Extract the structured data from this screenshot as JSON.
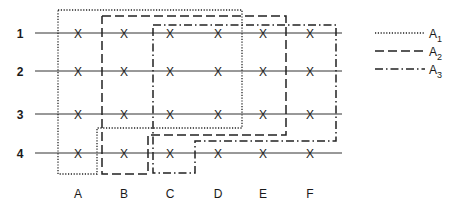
{
  "diagram": {
    "rows": [
      {
        "label": "1",
        "y": 33
      },
      {
        "label": "2",
        "y": 71
      },
      {
        "label": "3",
        "y": 114
      },
      {
        "label": "4",
        "y": 153
      }
    ],
    "columns": [
      {
        "label": "A",
        "x": 78
      },
      {
        "label": "B",
        "x": 124
      },
      {
        "label": "C",
        "x": 170
      },
      {
        "label": "D",
        "x": 218
      },
      {
        "label": "E",
        "x": 263
      },
      {
        "label": "F",
        "x": 310
      }
    ],
    "marker": "X",
    "line_x_start": 35,
    "line_x_end": 342,
    "column_label_y": 198,
    "regions": [
      {
        "name": "A1",
        "style": "dotted",
        "points": "58,10 242,10 242,128 97,128 97,174 58,174 58,10"
      },
      {
        "name": "A2",
        "style": "dashed",
        "points": "102,16 286,16 286,135 148,135 148,174 102,174 102,16"
      },
      {
        "name": "A3",
        "style": "dash-dot",
        "points": "153,25 336,25 336,141 195,141 195,173 153,173 153,25"
      }
    ],
    "legend": [
      {
        "base": "A",
        "sub": "1",
        "style": "dotted"
      },
      {
        "base": "A",
        "sub": "2",
        "style": "dashed"
      },
      {
        "base": "A",
        "sub": "3",
        "style": "dash-dot"
      }
    ]
  }
}
